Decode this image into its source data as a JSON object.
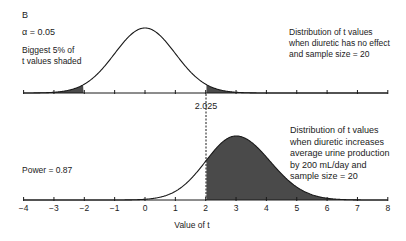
{
  "figure": {
    "panel_label": "B",
    "alpha_label": "α = 0.05",
    "shaded_note": "Biggest 5% of\nt values shaded",
    "null_caption": "Distribution of t values\nwhen diuretic has no effect\nand sample size = 20",
    "alt_caption": "Distribution of t values\nwhen diuretic increases\naverage urine production\nby 200 mL/day and\nsample size  =  20",
    "power_label": "Power = 0.87",
    "critical_label": "2.025",
    "xlabel": "Value of t"
  },
  "colors": {
    "line": "#1a1a1a",
    "shade": "#4a4a4a",
    "background": "#ffffff"
  },
  "chart_data": [
    {
      "type": "area",
      "title": "Distribution of t values when diuretic has no effect and sample size = 20",
      "distribution": "t",
      "center": 0,
      "degrees_of_freedom": 38,
      "alpha": 0.05,
      "critical_values": [
        -2.025,
        2.025
      ],
      "shaded_regions": [
        [
          -4,
          -2.025
        ],
        [
          2.025,
          8
        ]
      ],
      "shaded_note": "Biggest 5% of t values shaded",
      "x_ticks": [
        -4,
        -3,
        -2,
        -1,
        0,
        1,
        2,
        3,
        4,
        5,
        6,
        7,
        8
      ],
      "xlim": [
        -4,
        8
      ],
      "grid": false
    },
    {
      "type": "area",
      "title": "Distribution of t values when diuretic increases average urine production by 200 mL/day and sample size = 20",
      "distribution": "t (noncentral)",
      "center": 3.0,
      "critical_value": 2.025,
      "shaded_regions": [
        [
          2.025,
          8
        ]
      ],
      "power": 0.87,
      "x_ticks": [
        -4,
        -3,
        -2,
        -1,
        0,
        1,
        2,
        3,
        4,
        5,
        6,
        7,
        8
      ],
      "x_tick_labels": [
        "−4",
        "−3",
        "−2",
        "−1",
        "0",
        "1",
        "2",
        "3",
        "4",
        "5",
        "6",
        "7",
        "8"
      ],
      "xlabel": "Value of t",
      "xlim": [
        -4,
        8
      ],
      "grid": false
    }
  ]
}
